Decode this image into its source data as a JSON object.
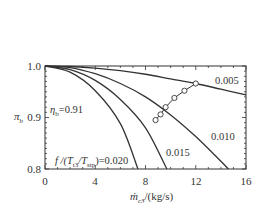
{
  "chart_data": {
    "type": "line",
    "title": "",
    "xlabel": "ṁc3/(kg/s)",
    "ylabel": "πb",
    "xlim": [
      0,
      16
    ],
    "ylim": [
      0.8,
      1.0
    ],
    "xticks": [
      0,
      4,
      8,
      12,
      16
    ],
    "yticks": [
      0.8,
      0.9,
      1.0
    ],
    "xtick_labels": [
      "0",
      "4",
      "8",
      "12",
      "16"
    ],
    "ytick_labels": [
      "0.8",
      "0.9",
      "1.0"
    ],
    "grid": false,
    "annotations": {
      "eta": "ηb=0.91",
      "param": "f/(T t3/T stp)=0.020"
    },
    "series": [
      {
        "name": "0.005",
        "x": [
          0,
          2,
          4,
          6,
          8,
          10,
          12,
          14,
          16
        ],
        "y": [
          1.0,
          0.999,
          0.996,
          0.991,
          0.984,
          0.975,
          0.966,
          0.955,
          0.944
        ]
      },
      {
        "name": "0.010",
        "x": [
          0,
          2,
          4,
          6,
          8,
          10,
          12,
          14,
          14.6
        ],
        "y": [
          1.0,
          0.997,
          0.985,
          0.966,
          0.94,
          0.905,
          0.863,
          0.815,
          0.8
        ]
      },
      {
        "name": "0.015",
        "x": [
          0,
          2,
          4,
          6,
          8,
          9.7
        ],
        "y": [
          1.0,
          0.993,
          0.972,
          0.935,
          0.88,
          0.8
        ]
      },
      {
        "name": "0.020",
        "x": [
          0,
          2,
          4,
          6,
          7.4
        ],
        "y": [
          1.0,
          0.988,
          0.952,
          0.888,
          0.8
        ]
      }
    ],
    "markers": {
      "name": "operating-line",
      "x": [
        12.0,
        11.1,
        10.3,
        9.6,
        9.2,
        8.8
      ],
      "y": [
        0.966,
        0.952,
        0.938,
        0.92,
        0.906,
        0.895
      ]
    },
    "curve_labels": [
      "0.005",
      "0.010",
      "0.015"
    ]
  },
  "labels": {
    "y_axis": "π",
    "y_axis_sub": "b",
    "x_axis_main": "ṁ",
    "x_axis_sub": "c3",
    "x_axis_unit": "/(kg/s)",
    "eta_sym": "η",
    "eta_sub": "b",
    "eta_val": "=0.91",
    "param_f": "f /(T",
    "param_sub1": "t3",
    "param_mid": "/T",
    "param_sub2": "stp",
    "param_val": ")=0.020",
    "curve_005": "0.005",
    "curve_010": "0.010",
    "curve_015": "0.015"
  }
}
